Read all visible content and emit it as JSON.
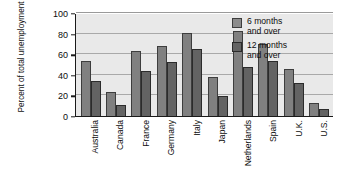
{
  "chart_data": {
    "type": "bar",
    "title": "",
    "subtitle": "",
    "xlabel": "",
    "ylabel": "Percent of total unemployment",
    "ylim": [
      0,
      100
    ],
    "yticks": [
      0,
      20,
      40,
      60,
      80,
      100
    ],
    "grid": true,
    "legend_position": "top-right",
    "categories": [
      "Australia",
      "Canada",
      "France",
      "Germany",
      "Italy",
      "Japan",
      "Netherlands",
      "Spain",
      "U.K.",
      "U.S."
    ],
    "series": [
      {
        "name": "6 months and over",
        "color": "#808080",
        "values": [
          53,
          23,
          63,
          68,
          81,
          38,
          83,
          70,
          46,
          13
        ]
      },
      {
        "name": "12 months and over",
        "color": "#636363",
        "values": [
          34,
          11,
          44,
          52,
          65,
          19,
          48,
          53,
          32,
          7
        ]
      }
    ]
  },
  "legend": {
    "entries": [
      {
        "label": "6 months\nand over"
      },
      {
        "label": "12 months\nand over"
      }
    ]
  },
  "axes": {
    "y_title": "Percent of total unemployment"
  },
  "colors": {
    "plot_background": "#e9e9e9",
    "axis": "#1a1a1a",
    "gridline": "#a9a9a9",
    "series_a": "#808080",
    "series_b": "#636363"
  }
}
